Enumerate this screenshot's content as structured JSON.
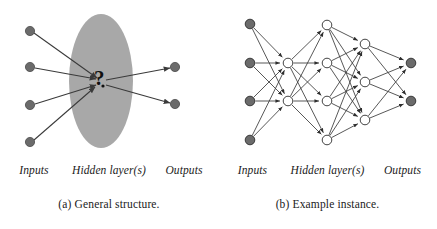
{
  "figure": {
    "panels": [
      {
        "id": "general-structure",
        "subcaption": "(a) General structure.",
        "layer_labels": {
          "inputs": "Inputs",
          "hidden": "Hidden layer(s)",
          "outputs": "Outputs"
        },
        "hidden_box_symbol": "?",
        "colors": {
          "node_fill": "#6b6b6b",
          "node_stroke": "#4a4a4a",
          "blob_fill": "#a8a8a8",
          "edge": "#3a3a3a",
          "text": "#1a1a1a"
        },
        "graph": {
          "type": "diagram",
          "input_nodes": [
            {
              "id": "i1",
              "x": 30,
              "y": 31
            },
            {
              "id": "i2",
              "x": 30,
              "y": 67
            },
            {
              "id": "i3",
              "x": 30,
              "y": 105
            },
            {
              "id": "i4",
              "x": 30,
              "y": 142
            }
          ],
          "output_nodes": [
            {
              "id": "o1",
              "x": 175,
              "y": 67
            },
            {
              "id": "o2",
              "x": 175,
              "y": 104
            }
          ],
          "hidden_blob": {
            "cx": 101,
            "cy": 81,
            "rx": 32,
            "ry": 67
          },
          "convergence_point": {
            "x": 99,
            "y": 80
          },
          "node_radius": 4.6,
          "edges_in": [
            {
              "from": "i1",
              "to": "convergence"
            },
            {
              "from": "i2",
              "to": "convergence"
            },
            {
              "from": "i3",
              "to": "convergence"
            },
            {
              "from": "i4",
              "to": "convergence"
            }
          ],
          "edges_out": [
            {
              "from": "convergence",
              "to": "o1"
            },
            {
              "from": "convergence",
              "to": "o2"
            }
          ]
        }
      },
      {
        "id": "example-instance",
        "subcaption": "(b) Example instance.",
        "layer_labels": {
          "inputs": "Inputs",
          "hidden": "Hidden layer(s)",
          "outputs": "Outputs"
        },
        "colors": {
          "node_fill_input": "#6b6b6b",
          "node_fill_hidden": "#ffffff",
          "node_fill_output": "#6b6b6b",
          "node_stroke": "#2e2e2e",
          "edge": "#3a3a3a",
          "text": "#1a1a1a"
        },
        "graph": {
          "type": "neural-network",
          "node_radius": 4.8,
          "layers": [
            {
              "name": "inputs",
              "kind": "input",
              "nodes": [
                {
                  "id": "a1",
                  "x": 32,
                  "y": 24
                },
                {
                  "id": "a2",
                  "x": 32,
                  "y": 63
                },
                {
                  "id": "a3",
                  "x": 32,
                  "y": 101
                },
                {
                  "id": "a4",
                  "x": 32,
                  "y": 140
                }
              ]
            },
            {
              "name": "hidden1",
              "kind": "hidden",
              "nodes": [
                {
                  "id": "b1",
                  "x": 70,
                  "y": 63
                },
                {
                  "id": "b2",
                  "x": 70,
                  "y": 101
                }
              ]
            },
            {
              "name": "hidden2",
              "kind": "hidden",
              "nodes": [
                {
                  "id": "c1",
                  "x": 109,
                  "y": 25
                },
                {
                  "id": "c2",
                  "x": 109,
                  "y": 63
                },
                {
                  "id": "c3",
                  "x": 109,
                  "y": 101
                },
                {
                  "id": "c4",
                  "x": 109,
                  "y": 140
                }
              ]
            },
            {
              "name": "hidden3",
              "kind": "hidden",
              "nodes": [
                {
                  "id": "d1",
                  "x": 147,
                  "y": 44
                },
                {
                  "id": "d2",
                  "x": 147,
                  "y": 82
                },
                {
                  "id": "d3",
                  "x": 147,
                  "y": 120
                }
              ]
            },
            {
              "name": "outputs",
              "kind": "output",
              "nodes": [
                {
                  "id": "e1",
                  "x": 193,
                  "y": 63
                },
                {
                  "id": "e2",
                  "x": 193,
                  "y": 101
                }
              ]
            }
          ],
          "edges": [
            {
              "from": "a1",
              "to": "b1"
            },
            {
              "from": "a1",
              "to": "b2"
            },
            {
              "from": "a2",
              "to": "b1"
            },
            {
              "from": "a2",
              "to": "b2"
            },
            {
              "from": "a3",
              "to": "b1"
            },
            {
              "from": "a3",
              "to": "b2"
            },
            {
              "from": "a4",
              "to": "b1"
            },
            {
              "from": "a4",
              "to": "b2"
            },
            {
              "from": "b1",
              "to": "c1"
            },
            {
              "from": "b1",
              "to": "c2"
            },
            {
              "from": "b1",
              "to": "c3"
            },
            {
              "from": "b1",
              "to": "c4"
            },
            {
              "from": "b2",
              "to": "c1"
            },
            {
              "from": "b2",
              "to": "c2"
            },
            {
              "from": "b2",
              "to": "c3"
            },
            {
              "from": "b2",
              "to": "c4"
            },
            {
              "from": "c1",
              "to": "d1"
            },
            {
              "from": "c1",
              "to": "d2"
            },
            {
              "from": "c1",
              "to": "d3"
            },
            {
              "from": "c2",
              "to": "d1"
            },
            {
              "from": "c2",
              "to": "d2"
            },
            {
              "from": "c2",
              "to": "d3"
            },
            {
              "from": "c3",
              "to": "d1"
            },
            {
              "from": "c3",
              "to": "d2"
            },
            {
              "from": "c3",
              "to": "d3"
            },
            {
              "from": "c4",
              "to": "d1"
            },
            {
              "from": "c4",
              "to": "d2"
            },
            {
              "from": "c4",
              "to": "d3"
            },
            {
              "from": "d1",
              "to": "e1"
            },
            {
              "from": "d1",
              "to": "e2"
            },
            {
              "from": "d2",
              "to": "e1"
            },
            {
              "from": "d2",
              "to": "e2"
            },
            {
              "from": "d3",
              "to": "e1"
            },
            {
              "from": "d3",
              "to": "e2"
            }
          ]
        }
      }
    ]
  }
}
